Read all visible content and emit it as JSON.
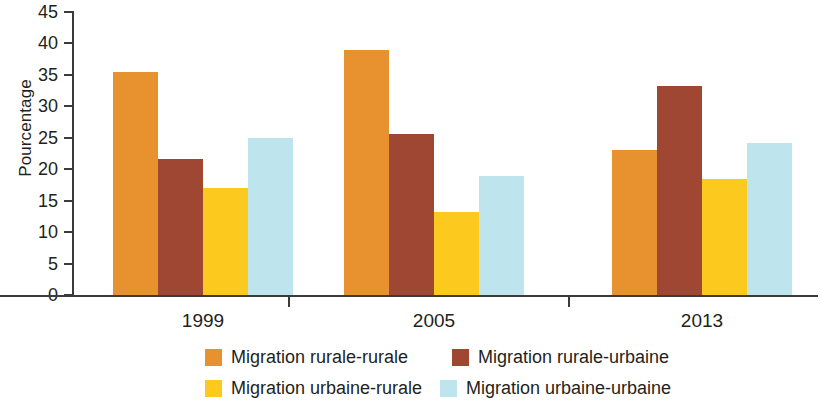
{
  "chart_data": {
    "type": "bar",
    "title": "",
    "xlabel": "",
    "ylabel": "Pourcentage",
    "ylim": [
      0,
      45
    ],
    "yticks": [
      0,
      5,
      10,
      15,
      20,
      25,
      30,
      35,
      40,
      45
    ],
    "grid": false,
    "legend_position": "bottom",
    "categories": [
      "1999",
      "2005",
      "2013"
    ],
    "series": [
      {
        "name": "Migration rurale-rurale",
        "color": "#E8912F",
        "values": [
          35.5,
          39.0,
          23.0
        ]
      },
      {
        "name": "Migration rurale-urbaine",
        "color": "#A04733",
        "values": [
          21.7,
          25.6,
          33.2
        ]
      },
      {
        "name": "Migration urbaine-rurale",
        "color": "#FCCA1E",
        "values": [
          17.0,
          13.2,
          18.5
        ]
      },
      {
        "name": "Migration urbaine-urbaine",
        "color": "#BEE5EE",
        "values": [
          24.9,
          19.0,
          24.2
        ]
      }
    ]
  },
  "axis": {
    "y_title": "Pourcentage",
    "tick_labels": [
      "45",
      "40",
      "35",
      "30",
      "25",
      "20",
      "15",
      "10",
      "5",
      "0"
    ],
    "category_labels": [
      "1999",
      "2005",
      "2013"
    ]
  },
  "legend": {
    "items": [
      {
        "label": "Migration rurale-rurale",
        "color": "#E8912F"
      },
      {
        "label": "Migration rurale-urbaine",
        "color": "#A04733"
      },
      {
        "label": "Migration urbaine-rurale",
        "color": "#FCCA1E"
      },
      {
        "label": "Migration urbaine-urbaine",
        "color": "#BEE5EE"
      }
    ]
  }
}
